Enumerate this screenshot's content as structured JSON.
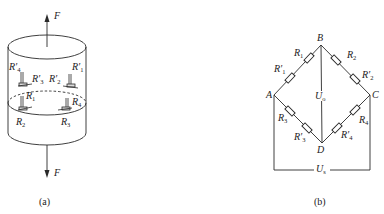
{
  "figure_a": {
    "caption": "(a)",
    "force_top": "F",
    "force_bottom": "F",
    "gauges": [
      {
        "id": "R4p",
        "base": "R",
        "sub": "4",
        "prime": true
      },
      {
        "id": "R3p",
        "base": "R",
        "sub": "3",
        "prime": true
      },
      {
        "id": "R2p",
        "base": "R",
        "sub": "2",
        "prime": true
      },
      {
        "id": "R1p",
        "base": "R",
        "sub": "1",
        "prime": true
      },
      {
        "id": "R1",
        "base": "R",
        "sub": "1",
        "prime": false
      },
      {
        "id": "R4",
        "base": "R",
        "sub": "4",
        "prime": false
      },
      {
        "id": "R2",
        "base": "R",
        "sub": "2",
        "prime": false
      },
      {
        "id": "R3",
        "base": "R",
        "sub": "3",
        "prime": false
      }
    ]
  },
  "figure_b": {
    "caption": "(b)",
    "nodes": {
      "A": "A",
      "B": "B",
      "C": "C",
      "D": "D"
    },
    "output_voltage": {
      "base": "U",
      "sub": "o"
    },
    "supply_voltage": {
      "base": "U",
      "sub": "s"
    },
    "resistors": [
      {
        "id": "R1",
        "base": "R",
        "sub": "1",
        "prime": false,
        "branch": "A-B"
      },
      {
        "id": "R1p",
        "base": "R",
        "sub": "1",
        "prime": true,
        "branch": "A-B"
      },
      {
        "id": "R2",
        "base": "R",
        "sub": "2",
        "prime": false,
        "branch": "B-C"
      },
      {
        "id": "R2p",
        "base": "R",
        "sub": "2",
        "prime": true,
        "branch": "B-C"
      },
      {
        "id": "R3",
        "base": "R",
        "sub": "3",
        "prime": false,
        "branch": "A-D"
      },
      {
        "id": "R3p",
        "base": "R",
        "sub": "3",
        "prime": true,
        "branch": "A-D"
      },
      {
        "id": "R4",
        "base": "R",
        "sub": "4",
        "prime": false,
        "branch": "C-D"
      },
      {
        "id": "R4p",
        "base": "R",
        "sub": "4",
        "prime": true,
        "branch": "C-D"
      }
    ]
  },
  "colors": {
    "line": "#2a2a2a",
    "background": "#ffffff"
  }
}
